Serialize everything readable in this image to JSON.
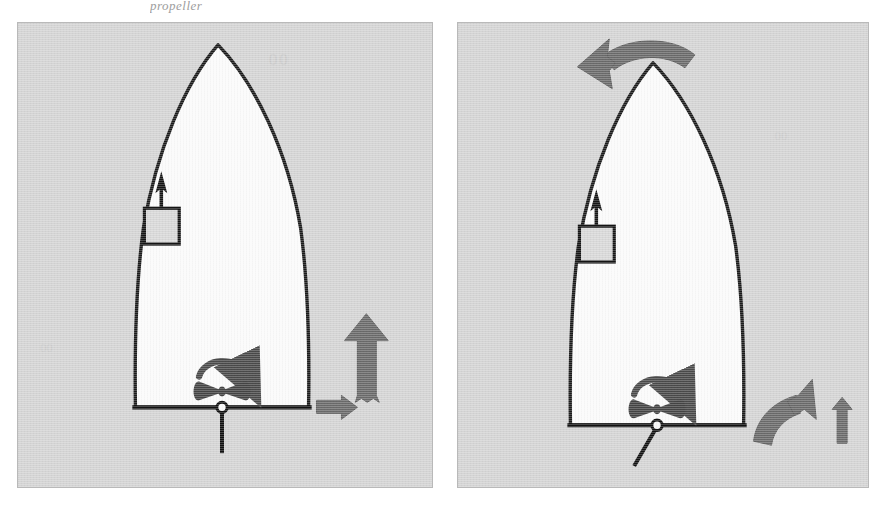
{
  "figure": {
    "caption_top": "propeller",
    "background_color": "#ffffff",
    "panel_fill": "#d4d4d4",
    "panel_border": "#b9b9b9",
    "hull_fill": "#fbfbfb",
    "hull_stroke": "#1a1a1a",
    "force_arrow_color": "#6a6a6a",
    "detail_color": "#2b2b2b"
  },
  "panels": [
    {
      "id": "left",
      "name": "rudder-amidships",
      "ghost_marks": [
        "00",
        "00"
      ],
      "hull": {
        "name": "boat-hull-plan-view",
        "description": "pointed-bow hull seen from above with flat transom"
      },
      "bow_thruster": {
        "name": "bow-thruster",
        "arrow_direction": "up",
        "box_label": ""
      },
      "propeller": {
        "name": "propeller",
        "rotation": "clockwise",
        "rotation_arrow": "clockwise-arc"
      },
      "rudder": {
        "name": "rudder",
        "angle_deg": 0,
        "position": "amidships"
      },
      "force_arrows": [
        {
          "name": "forward-thrust-arrow",
          "direction": "up",
          "size": "large"
        },
        {
          "name": "lateral-drift-arrow",
          "direction": "right",
          "size": "small"
        }
      ]
    },
    {
      "id": "right",
      "name": "rudder-to-port",
      "ghost_marks": [],
      "hull": {
        "name": "boat-hull-plan-view",
        "description": "pointed-bow hull seen from above with flat transom"
      },
      "bow_thruster": {
        "name": "bow-thruster",
        "arrow_direction": "up",
        "box_label": ""
      },
      "propeller": {
        "name": "propeller",
        "rotation": "clockwise",
        "rotation_arrow": "clockwise-arc"
      },
      "rudder": {
        "name": "rudder",
        "angle_deg": 30,
        "position": "turned-to-port"
      },
      "force_arrows": [
        {
          "name": "bow-swing-arrow",
          "direction": "curved-left",
          "size": "large"
        },
        {
          "name": "stern-thrust-curved-arrow",
          "direction": "curved-up-right",
          "size": "large"
        },
        {
          "name": "forward-thrust-arrow",
          "direction": "up",
          "size": "small"
        }
      ]
    }
  ]
}
